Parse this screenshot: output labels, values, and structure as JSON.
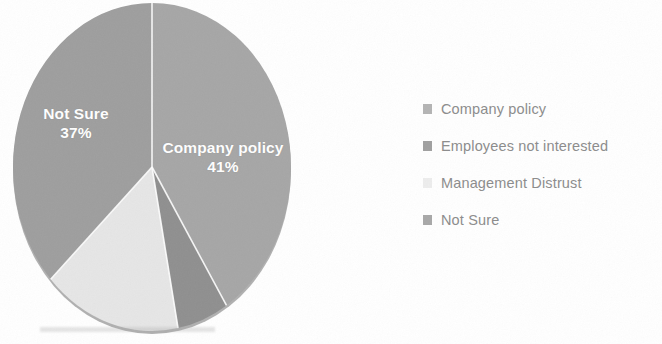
{
  "chart_data": {
    "type": "pie",
    "title": "",
    "subtitle": "",
    "xlabel": "",
    "ylabel": "",
    "legend_position": "right",
    "grid": false,
    "start_angle_deg": 0,
    "direction": "clockwise",
    "categories": [
      "Company policy",
      "Employees not interested",
      "Management Distrust",
      "Not Sure"
    ],
    "values": [
      41,
      6,
      16,
      37
    ],
    "slices": [
      {
        "label": "Company policy",
        "value": 41,
        "percent_text": "41%",
        "color": "#a6a6a6",
        "start_deg": 0,
        "end_deg": 147.6,
        "label_shown_on_pie": true,
        "pie_label_line1": "Company policy",
        "pie_label_line2": "41%"
      },
      {
        "label": "Employees not interested",
        "value": 6,
        "percent_text": "",
        "color": "#8f8f8f",
        "start_deg": 147.6,
        "end_deg": 169.2,
        "label_shown_on_pie": false,
        "pie_label_line1": "",
        "pie_label_line2": ""
      },
      {
        "label": "Management Distrust",
        "value": 16,
        "percent_text": "",
        "color": "#e6e6e6",
        "start_deg": 169.2,
        "end_deg": 226.8,
        "label_shown_on_pie": false,
        "pie_label_line1": "",
        "pie_label_line2": ""
      },
      {
        "label": "Not Sure",
        "value": 37,
        "percent_text": "37%",
        "color": "#9e9e9e",
        "start_deg": 226.8,
        "end_deg": 360,
        "label_shown_on_pie": true,
        "pie_label_line1": "Not Sure",
        "pie_label_line2": "37%"
      }
    ]
  },
  "pie": {
    "center_x": 152,
    "center_y": 167,
    "radius_x": 139,
    "radius_y": 164,
    "separator_color": "#ffffff",
    "edge_shadow_color": "#7d7d7d",
    "labels": {
      "company": {
        "line1": "Company policy",
        "line2": "41%"
      },
      "notsure": {
        "line1": "Not Sure",
        "line2": "37%"
      }
    }
  },
  "legend": {
    "items": [
      {
        "label": "Company policy",
        "swatch_color": "#b4b4b4"
      },
      {
        "label": "Employees not interested",
        "swatch_color": "#a0a0a0"
      },
      {
        "label": "Management Distrust",
        "swatch_color": "#ededed"
      },
      {
        "label": "Not Sure",
        "swatch_color": "#a8a8a8"
      }
    ]
  },
  "theme": {
    "background": "#ffffff",
    "legend_text_color": "#8c8c8c",
    "pie_label_text_color": "#ffffff"
  }
}
